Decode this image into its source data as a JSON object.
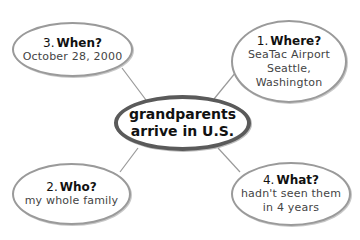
{
  "diagram": {
    "type": "cluster-map",
    "center": {
      "line1": "grandparents",
      "line2": "arrive in U.S."
    },
    "nodes": [
      {
        "id": "where",
        "number": "1.",
        "question": "Where?",
        "answer_lines": [
          "SeaTac Airport",
          "Seattle,",
          "Washington"
        ]
      },
      {
        "id": "who",
        "number": "2.",
        "question": "Who?",
        "answer_lines": [
          "my whole family"
        ]
      },
      {
        "id": "when",
        "number": "3.",
        "question": "When?",
        "answer_lines": [
          "October 28, 2000"
        ]
      },
      {
        "id": "what",
        "number": "4.",
        "question": "What?",
        "answer_lines": [
          "hadn't seen them",
          "in 4 years"
        ]
      }
    ],
    "colors": {
      "center_border": "#5a5a5a",
      "bubble_border": "#9a9a9a",
      "connector": "#9a9a9a",
      "question_text": "#111111",
      "answer_text": "#444444"
    }
  }
}
